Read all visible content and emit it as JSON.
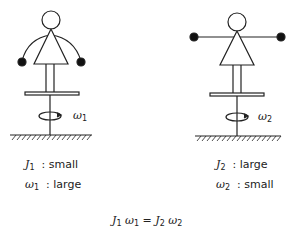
{
  "left_figure": {
    "omega_label": "ω",
    "omega_sub": "1",
    "J_label": "J",
    "J_sub": "1",
    "J_value": ": small",
    "w_label": "ω",
    "w_sub": "1",
    "w_value": ": large",
    "arms": "curved-down-weights-close"
  },
  "right_figure": {
    "omega_label": "ω",
    "omega_sub": "2",
    "J_label": "J",
    "J_sub": "2",
    "J_value": ": large",
    "w_label": "ω",
    "w_sub": "2",
    "w_value": ": small",
    "arms": "extended-horizontal-weights-far"
  },
  "equation": {
    "J1": "J",
    "J1_sub": "1",
    "w1": "ω",
    "w1_sub": "1",
    "eq": "=",
    "J2": "J",
    "J2_sub": "2",
    "w2": "ω",
    "w2_sub": "2"
  }
}
